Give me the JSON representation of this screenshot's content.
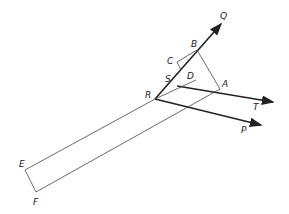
{
  "diagram": {
    "points": {
      "Q": {
        "label": "Q",
        "x": 222,
        "y": 23
      },
      "B": {
        "label": "B",
        "x": 197,
        "y": 50
      },
      "C": {
        "label": "C",
        "x": 177,
        "y": 62
      },
      "S": {
        "label": "S",
        "x": 181,
        "y": 86
      },
      "D": {
        "label": "D",
        "x": 191,
        "y": 79
      },
      "R": {
        "label": "R",
        "x": 155,
        "y": 99
      },
      "A": {
        "label": "A",
        "x": 220,
        "y": 89
      },
      "T": {
        "label": "T",
        "x": 274,
        "y": 102
      },
      "P": {
        "label": "P",
        "x": 262,
        "y": 125
      },
      "E": {
        "label": "E",
        "x": 25,
        "y": 170
      },
      "F": {
        "label": "F",
        "x": 36,
        "y": 192
      }
    },
    "rays": [
      "RQ",
      "ST",
      "RP"
    ],
    "segments": [
      "BA",
      "BC",
      "CS",
      "RD",
      "RE",
      "EF",
      "FA"
    ],
    "stroke_color": "#222222"
  }
}
